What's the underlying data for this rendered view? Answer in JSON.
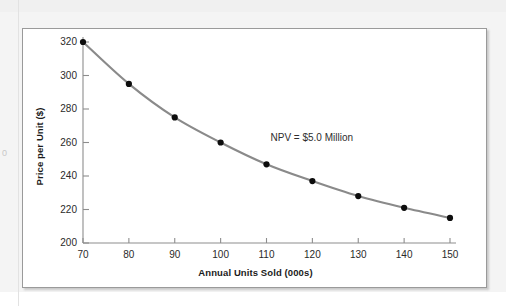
{
  "chart_data": {
    "type": "line",
    "title": "",
    "xlabel": "Annual Units Sold (000s)",
    "ylabel": "Price per Unit ($)",
    "x": [
      70,
      80,
      90,
      100,
      110,
      120,
      130,
      140,
      150
    ],
    "values": [
      320,
      295,
      275,
      260,
      247,
      237,
      228,
      221,
      215
    ],
    "series": [
      {
        "name": "NPV = $5.0 Million",
        "values": [
          320,
          295,
          275,
          260,
          247,
          237,
          228,
          221,
          215
        ]
      }
    ],
    "xlim": [
      70,
      150
    ],
    "ylim": [
      200,
      320
    ],
    "xticks": [
      70,
      80,
      90,
      100,
      110,
      120,
      130,
      140,
      150
    ],
    "yticks": [
      200,
      220,
      240,
      260,
      280,
      300,
      320
    ],
    "xtick_labels": [
      "70",
      "80",
      "90",
      "100",
      "110",
      "120",
      "130",
      "140",
      "150"
    ],
    "ytick_labels": [
      "200",
      "220",
      "240",
      "260",
      "280",
      "300",
      "320"
    ],
    "grid": false,
    "legend": "none",
    "annotations": [
      {
        "text": "NPV = $5.0 Million",
        "x": 110,
        "y": 262
      }
    ],
    "colors": {
      "line": "#8a8a8a",
      "marker": "#0d0d0d",
      "axis": "#8d8d8d",
      "text": "#1b1b1b",
      "panel_border": "#9a9a9a",
      "panel_background": "#ffffff",
      "page_background": "#f4f4f4"
    },
    "marker_style": "filled-circle",
    "line_style": "solid"
  },
  "figure": {
    "annotation_label": "NPV = $5.0 Million",
    "edge_artifact": "0"
  }
}
